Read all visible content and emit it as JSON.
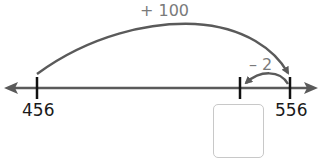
{
  "number_line": {
    "start_value": "456",
    "end_value": "556",
    "unknown_value": "",
    "line_color": "#5a5a5a",
    "tick_color": "#111111"
  },
  "jumps": [
    {
      "label": "+ 100",
      "from": "456",
      "to": "556",
      "arc_color": "#5a5a5a"
    },
    {
      "label": "– 2",
      "from": "556",
      "to": "?",
      "arc_color": "#5a5a5a"
    }
  ],
  "answer_box": {
    "value": "",
    "border_color": "#c8c8c8"
  }
}
